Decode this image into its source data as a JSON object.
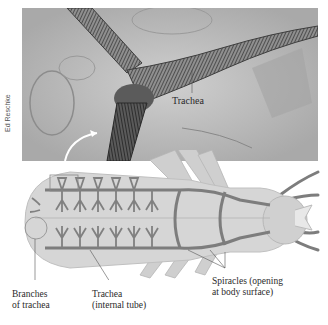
{
  "figure": {
    "photo": {
      "label": "Trachea",
      "credit": "Ed Reschke"
    },
    "diagram": {
      "labels": {
        "branches": [
          "Branches",
          "of trachea"
        ],
        "trachea": [
          "Trachea",
          "(internal tube)"
        ],
        "spiracles": [
          "Spiracles (opening",
          "at body surface)"
        ]
      }
    },
    "colors": {
      "photo_bg": "#b9b9b9",
      "body_fill": "#d6d6d6",
      "trachea_stroke": "#7d7d7d",
      "label_text": "#2a2a2a"
    }
  }
}
